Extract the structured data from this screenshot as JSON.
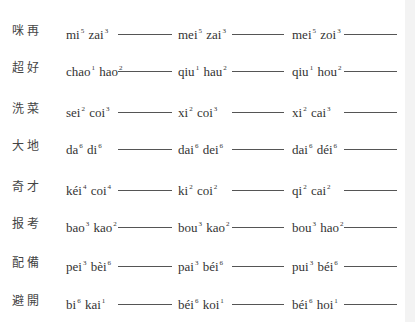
{
  "worksheet": {
    "rows": [
      {
        "hanzi": "咪再",
        "options": [
          [
            {
              "s": "mi",
              "t": "5"
            },
            {
              "s": "zai",
              "t": "3"
            }
          ],
          [
            {
              "s": "mei",
              "t": "5"
            },
            {
              "s": "zai",
              "t": "3"
            }
          ],
          [
            {
              "s": "mei",
              "t": "5"
            },
            {
              "s": "zoi",
              "t": "3"
            }
          ]
        ]
      },
      {
        "hanzi": "超好",
        "options": [
          [
            {
              "s": "chao",
              "t": "1"
            },
            {
              "s": "hao",
              "t": "2"
            }
          ],
          [
            {
              "s": "qiu",
              "t": "1"
            },
            {
              "s": "hau",
              "t": "2"
            }
          ],
          [
            {
              "s": "qiu",
              "t": "1"
            },
            {
              "s": "hou",
              "t": "2"
            }
          ]
        ]
      },
      {
        "hanzi": "洗菜",
        "options": [
          [
            {
              "s": "sei",
              "t": "2"
            },
            {
              "s": "coi",
              "t": "3"
            }
          ],
          [
            {
              "s": "xi",
              "t": "2"
            },
            {
              "s": "coi",
              "t": "3"
            }
          ],
          [
            {
              "s": "xi",
              "t": "2"
            },
            {
              "s": "cai",
              "t": "3"
            }
          ]
        ]
      },
      {
        "hanzi": "大地",
        "options": [
          [
            {
              "s": "da",
              "t": "6"
            },
            {
              "s": "di",
              "t": "6"
            }
          ],
          [
            {
              "s": "dai",
              "t": "6"
            },
            {
              "s": "dei",
              "t": "6"
            }
          ],
          [
            {
              "s": "dai",
              "t": "6"
            },
            {
              "s": "déi",
              "t": "6"
            }
          ]
        ]
      },
      {
        "hanzi": "奇才",
        "options": [
          [
            {
              "s": "kéi",
              "t": "4"
            },
            {
              "s": "coi",
              "t": "4"
            }
          ],
          [
            {
              "s": "ki",
              "t": "2"
            },
            {
              "s": "coi",
              "t": "2"
            }
          ],
          [
            {
              "s": "qi",
              "t": "2"
            },
            {
              "s": "cai",
              "t": "2"
            }
          ]
        ]
      },
      {
        "hanzi": "报考",
        "options": [
          [
            {
              "s": "bao",
              "t": "3"
            },
            {
              "s": "kao",
              "t": "2"
            }
          ],
          [
            {
              "s": "bou",
              "t": "3"
            },
            {
              "s": "kao",
              "t": "2"
            }
          ],
          [
            {
              "s": "bou",
              "t": "3"
            },
            {
              "s": "hao",
              "t": "2"
            }
          ]
        ]
      },
      {
        "hanzi": "配備",
        "options": [
          [
            {
              "s": "pei",
              "t": "3"
            },
            {
              "s": "bèi",
              "t": "6"
            }
          ],
          [
            {
              "s": "pai",
              "t": "3"
            },
            {
              "s": "béi",
              "t": "6"
            }
          ],
          [
            {
              "s": "pui",
              "t": "3"
            },
            {
              "s": "béi",
              "t": "6"
            }
          ]
        ]
      },
      {
        "hanzi": "避開",
        "options": [
          [
            {
              "s": "bi",
              "t": "6"
            },
            {
              "s": "kai",
              "t": "1"
            }
          ],
          [
            {
              "s": "béi",
              "t": "6"
            },
            {
              "s": "koi",
              "t": "1"
            }
          ],
          [
            {
              "s": "béi",
              "t": "6"
            },
            {
              "s": "hoi",
              "t": "1"
            }
          ]
        ]
      }
    ],
    "row_tops": [
      21,
      58,
      99,
      136,
      177,
      214,
      253,
      291
    ],
    "colors": {
      "text": "#333333",
      "line": "#555555",
      "strip": "#f3f3f3"
    }
  }
}
